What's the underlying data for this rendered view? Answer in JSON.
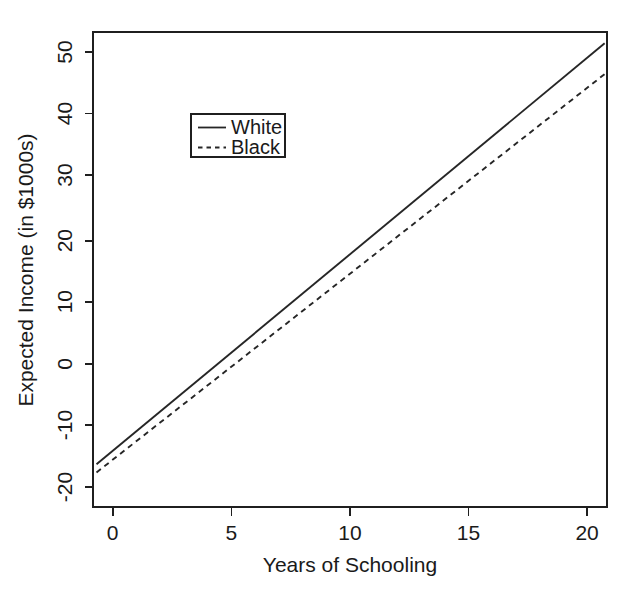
{
  "chart_data": {
    "type": "line",
    "title": "",
    "subtitle": "",
    "xlabel": "Years of Schooling",
    "ylabel": "Expected Income (in $1000s)",
    "xlim": [
      -0.95,
      21.1
    ],
    "ylim": [
      -22.6,
      53.0
    ],
    "xticks": [
      0,
      5,
      10,
      15,
      20
    ],
    "xtick_labels": [
      "0",
      "5",
      "10",
      "15",
      "20"
    ],
    "yticks": [
      -20,
      -10,
      0,
      10,
      20,
      30,
      40,
      50
    ],
    "ytick_labels": [
      "-20",
      "-10",
      "0",
      "10",
      "20",
      "30",
      "40",
      "50"
    ],
    "grid": false,
    "legend_position": "upper-left-inside",
    "legend_entries": [
      {
        "name": "White",
        "style": "solid"
      },
      {
        "name": "Black",
        "style": "dashed"
      }
    ],
    "series": [
      {
        "name": "White",
        "style": "solid",
        "color": "#262626",
        "x": [
          -0.8,
          21.0
        ],
        "values": [
          -15.8,
          51.2
        ],
        "slope": 3.07,
        "intercept": -13.3
      },
      {
        "name": "Black",
        "style": "dashed",
        "color": "#262626",
        "x": [
          -0.8,
          21.0
        ],
        "values": [
          -17.1,
          46.3
        ],
        "slope": 2.91,
        "intercept": -14.8
      }
    ]
  },
  "figure": {
    "background_color": "#ffffff",
    "foreground_color": "#1a1a1a"
  }
}
